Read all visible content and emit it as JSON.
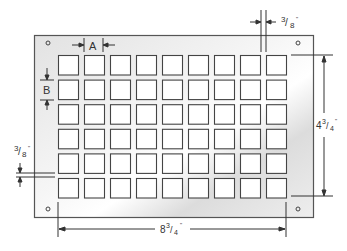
{
  "diagram": {
    "type": "perforated-plate-dimension-drawing",
    "plate": {
      "width_label": "8",
      "width_frac_num": "3",
      "width_frac_den": "4",
      "width_unit": "\"",
      "height_label": "4",
      "height_frac_num": "3",
      "height_frac_den": "4",
      "height_unit": "\""
    },
    "grid": {
      "columns": 9,
      "rows": 6
    },
    "labels": {
      "A": "A",
      "B": "B",
      "top_margin_num": "3",
      "top_margin_den": "8",
      "left_margin_num": "3",
      "left_margin_den": "8",
      "inch": "\""
    },
    "mounting_holes": 4,
    "colors": {
      "line": "#444444",
      "plate_light": "#ffffff",
      "plate_shade": "#d8d8d8"
    }
  }
}
